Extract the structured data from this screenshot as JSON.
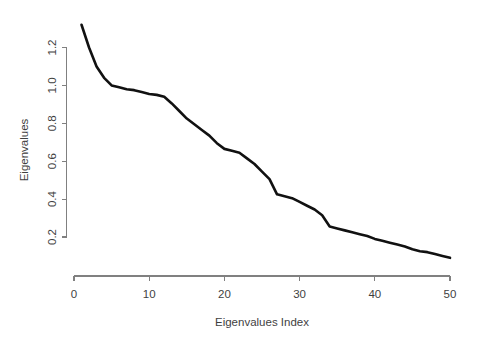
{
  "chart_data": {
    "type": "line",
    "title": "",
    "subtitle": "",
    "xlabel": "Eigenvalues Index",
    "ylabel": "Eigenvalues",
    "grid": false,
    "legend": "none",
    "xlim": [
      0,
      50
    ],
    "ylim": [
      0.09,
      1.32
    ],
    "xticks": [
      0,
      10,
      20,
      30,
      40,
      50
    ],
    "xtick_labels": [
      "0",
      "10",
      "20",
      "30",
      "40",
      "50"
    ],
    "yticks": [
      0.2,
      0.4,
      0.6,
      0.8,
      1.0,
      1.2
    ],
    "ytick_labels": [
      "0.2",
      "0.4",
      "0.6",
      "0.8",
      "1.0",
      "1.2"
    ],
    "line_color": "#111111",
    "axis_color": "#808080",
    "series": [
      {
        "name": "Eigenvalues",
        "x": [
          1,
          2,
          3,
          4,
          5,
          6,
          7,
          8,
          9,
          10,
          11,
          12,
          13,
          14,
          15,
          16,
          17,
          18,
          19,
          20,
          21,
          22,
          23,
          24,
          25,
          26,
          27,
          28,
          29,
          30,
          31,
          32,
          33,
          34,
          35,
          36,
          37,
          38,
          39,
          40,
          41,
          42,
          43,
          44,
          45,
          46,
          47,
          48,
          49,
          50
        ],
        "values": [
          1.32,
          1.2,
          1.1,
          1.04,
          1.0,
          0.99,
          0.98,
          0.975,
          0.965,
          0.955,
          0.95,
          0.94,
          0.905,
          0.865,
          0.825,
          0.795,
          0.765,
          0.735,
          0.695,
          0.665,
          0.655,
          0.645,
          0.615,
          0.585,
          0.545,
          0.505,
          0.425,
          0.415,
          0.405,
          0.385,
          0.365,
          0.345,
          0.315,
          0.255,
          0.245,
          0.235,
          0.225,
          0.215,
          0.205,
          0.19,
          0.18,
          0.17,
          0.16,
          0.15,
          0.135,
          0.125,
          0.12,
          0.11,
          0.1,
          0.09
        ]
      }
    ]
  },
  "axes": {
    "y_title": "Eigenvalues",
    "x_title": "Eigenvalues Index"
  }
}
